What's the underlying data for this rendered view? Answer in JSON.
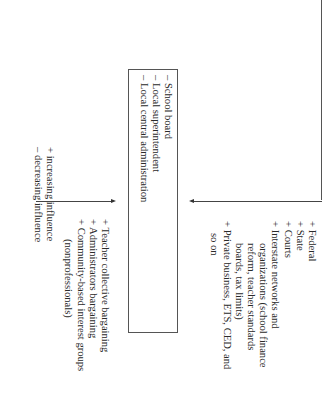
{
  "diagram": {
    "orientation": "rotated-90-clockwise",
    "external_influences": {
      "items": [
        {
          "sign": "+",
          "label": "Federal"
        },
        {
          "sign": "+",
          "label": "State"
        },
        {
          "sign": "+",
          "label": "Courts"
        },
        {
          "sign": "+",
          "label": "Interstate networks and",
          "continuation": [
            "organizations (school finance",
            "reform, teacher standards",
            "boards, tax limits)"
          ]
        },
        {
          "sign": "+",
          "label": "Private business, ETS, CED, and",
          "continuation": [
            "so on"
          ]
        }
      ]
    },
    "local_governance_box": {
      "items": [
        {
          "sign": "–",
          "label": "School board"
        },
        {
          "sign": "–",
          "label": "Local superintendent"
        },
        {
          "sign": "–",
          "label": "Local central administration"
        }
      ]
    },
    "internal_influences": {
      "items": [
        {
          "sign": "+",
          "label": "Teacher collective bargaining"
        },
        {
          "sign": "+",
          "label": "Administrators bargaining"
        },
        {
          "sign": "+",
          "label": "Community-based interest groups",
          "continuation": [
            "(nonprofessionals)"
          ]
        }
      ]
    },
    "legend": {
      "items": [
        {
          "sign": "+",
          "label": "increasing influence"
        },
        {
          "sign": "–",
          "label": "decreasing influence"
        }
      ]
    },
    "colors": {
      "line": "#444444",
      "text": "#2a2a2a",
      "background": "#ffffff"
    }
  }
}
